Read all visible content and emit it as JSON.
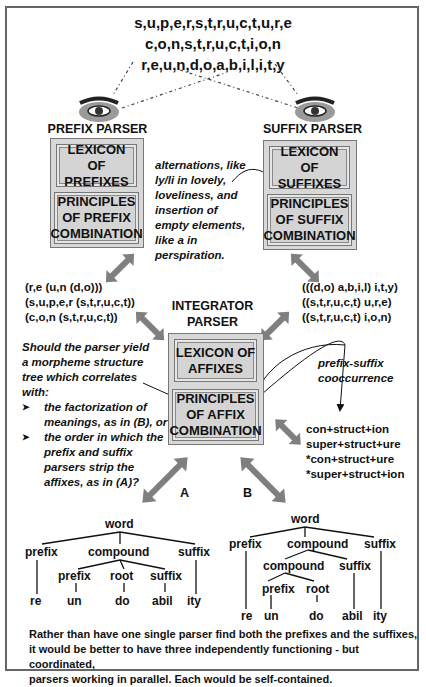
{
  "input_words": [
    "s,u,p,e,r,s,t,r,u,c,t,u,r,e",
    "c,o,n,s,t,r,u,c,t,i,o,n",
    "r,e,u,n,d,o,a,b,i,l,i,t,y"
  ],
  "prefix_parser": {
    "title": "PREFIX PARSER",
    "eye_icon": "eye-icon",
    "lexicon": [
      "LEXICON OF",
      "PREFIXES"
    ],
    "principles": [
      "PRINCIPLES",
      "OF PREFIX",
      "COMBINATION"
    ],
    "outputs": [
      "(r,e (u,n (d,o)))",
      "(s,u,p,e,r (s,t,r,u,c,t))",
      "(c,o,n (s,t,r,u,c,t))"
    ]
  },
  "suffix_parser": {
    "title": "SUFFIX PARSER",
    "eye_icon": "eye-icon",
    "lexicon": [
      "LEXICON OF",
      "SUFFIXES"
    ],
    "principles": [
      "PRINCIPLES",
      "OF SUFFIX",
      "COMBINATION"
    ],
    "outputs": [
      "(((d,o) a,b,i,l) i,t,y)",
      "((s,t,r,u,c,t) u,r,e)",
      "((s,t,r,u,c,t) i,o,n)"
    ]
  },
  "alternations_note": [
    "alternations, like",
    "ly/li in lovely,",
    "loveliness, and",
    "insertion of",
    "empty elements,",
    "like a in",
    "perspiration."
  ],
  "integrator_parser": {
    "title": [
      "INTEGRATOR",
      "PARSER"
    ],
    "lexicon": [
      "LEXICON OF",
      "AFFIXES"
    ],
    "principles": [
      "PRINCIPLES",
      "OF AFFIX",
      "COMBINATION"
    ]
  },
  "cooccurrence_note": [
    "prefix-suffix",
    "cooccurrence"
  ],
  "combinations": [
    "con+struct+ion",
    "super+struct+ure",
    "*con+struct+ure",
    "*super+struct+ion"
  ],
  "question": {
    "intro": [
      "Should the parser yield",
      "a morpheme structure",
      "tree which correlates",
      "with:"
    ],
    "bullet_glyph": "➤",
    "options": [
      [
        "the factorization of",
        "meanings, as in (B), or"
      ],
      [
        "the order in which the",
        "prefix and suffix",
        "parsers strip the",
        "affixes, as in (A)?"
      ]
    ]
  },
  "tree_a": {
    "label": "A",
    "root": "word",
    "level1": [
      "prefix",
      "compound",
      "suffix"
    ],
    "level2": [
      "prefix",
      "root",
      "suffix"
    ],
    "leaves": [
      "re",
      "un",
      "do",
      "abil",
      "ity"
    ]
  },
  "tree_b": {
    "label": "B",
    "root": "word",
    "level1": [
      "prefix",
      "compound",
      "suffix"
    ],
    "level2": [
      "compound",
      "suffix"
    ],
    "level3": [
      "prefix",
      "root"
    ],
    "leaves": [
      "re",
      "un",
      "do",
      "abil",
      "ity"
    ]
  },
  "conclusion": [
    "Rather than have one single parser find both the prefixes and the suffixes,",
    "it would be better to have three independently functioning - but coordinated,",
    "parsers working in parallel. Each would be self-contained."
  ],
  "colors": {
    "box_fill": "#d6d6d6",
    "box_border": "#777777",
    "arrow_gray": "#7f7f7f",
    "text": "#111111"
  }
}
